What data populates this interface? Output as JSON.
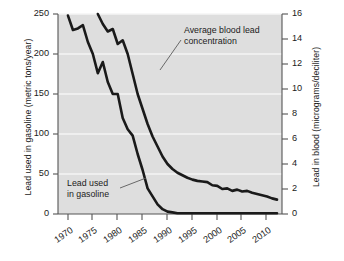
{
  "chart_data": {
    "type": "line",
    "title": "",
    "xlabel": "",
    "ylabel": "Lead used in gasoline (metric tons/year)",
    "ylabel_right": "Lead in blood (micrograms/deciliter)",
    "xlim": [
      1968,
      2013
    ],
    "ylim": [
      0,
      250
    ],
    "ylim_right": [
      0,
      16
    ],
    "grid": true,
    "legend": "none",
    "xticks": [
      "1970",
      "1975",
      "1980",
      "1985",
      "1990",
      "1995",
      "2000",
      "2005",
      "2010"
    ],
    "xtick_values": [
      1970,
      1975,
      1980,
      1985,
      1990,
      1995,
      2000,
      2005,
      2010
    ],
    "yticks_left": [
      "0",
      "50",
      "100",
      "150",
      "200",
      "250"
    ],
    "ytick_values_left": [
      0,
      50,
      100,
      150,
      200,
      250
    ],
    "yticks_right": [
      "0",
      "2",
      "4",
      "6",
      "8",
      "10",
      "12",
      "14",
      "16"
    ],
    "ytick_values_right": [
      0,
      2,
      4,
      6,
      8,
      10,
      12,
      14,
      16
    ],
    "annotations": [
      {
        "name": "blood-lead-annotation",
        "line1": "Average blood lead",
        "line2": "concentration"
      },
      {
        "name": "gasoline-lead-annotation",
        "line1": "Lead used",
        "line2": "in gasoline"
      }
    ],
    "series": [
      {
        "name": "Lead used in gasoline",
        "axis": "left",
        "units": "metric tons/year",
        "x": [
          1970,
          1971,
          1972,
          1973,
          1974,
          1975,
          1976,
          1977,
          1978,
          1979,
          1980,
          1981,
          1982,
          1983,
          1984,
          1985,
          1986,
          1987,
          1988,
          1989,
          1990,
          1991,
          1992,
          1993,
          1994,
          1995,
          1996,
          2000,
          2005,
          2010,
          2012
        ],
        "values": [
          248,
          230,
          232,
          236,
          215,
          200,
          176,
          190,
          165,
          150,
          150,
          120,
          106,
          98,
          75,
          55,
          32,
          22,
          12,
          6,
          3,
          2,
          1,
          1,
          1,
          1,
          1,
          1,
          1,
          1,
          1
        ]
      },
      {
        "name": "Average blood lead concentration",
        "axis": "right",
        "units": "micrograms/deciliter",
        "x": [
          1976,
          1977,
          1978,
          1979,
          1980,
          1981,
          1982,
          1983,
          1984,
          1985,
          1986,
          1987,
          1988,
          1989,
          1990,
          1991,
          1992,
          1993,
          1994,
          1995,
          1996,
          1997,
          1998,
          1999,
          2000,
          2001,
          2002,
          2003,
          2004,
          2005,
          2006,
          2007,
          2008,
          2009,
          2010,
          2011,
          2012
        ],
        "values": [
          16.0,
          15.2,
          14.6,
          14.8,
          13.6,
          13.9,
          12.8,
          11.2,
          9.6,
          8.4,
          7.2,
          6.2,
          5.4,
          4.6,
          4.0,
          3.6,
          3.3,
          3.1,
          2.9,
          2.75,
          2.65,
          2.6,
          2.55,
          2.3,
          2.25,
          2.0,
          2.05,
          1.85,
          1.95,
          1.8,
          1.85,
          1.7,
          1.6,
          1.5,
          1.4,
          1.25,
          1.15
        ]
      }
    ],
    "colors": {
      "plot_background": "#dedede",
      "line": "#1a1a1a",
      "gridline": "#f4f4f4",
      "axis": "#4a4a4a",
      "text": "#1b1b1b",
      "figure_background": "#ffffff"
    }
  }
}
